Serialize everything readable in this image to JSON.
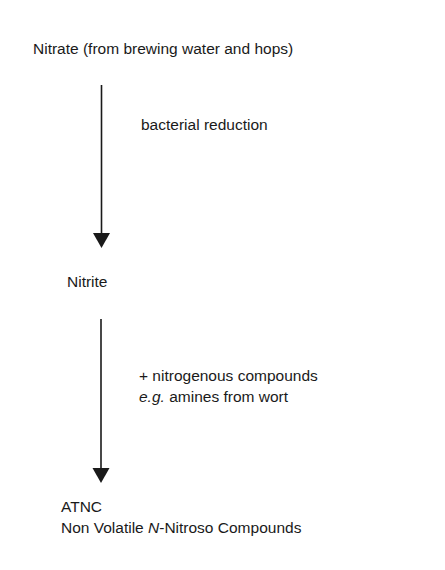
{
  "diagram": {
    "nodes": {
      "nitrate": "Nitrate (from brewing water and hops)",
      "nitrite": "Nitrite",
      "atnc_line1": "ATNC",
      "atnc_line2_pre": "Non Volatile ",
      "atnc_line2_italic": "N",
      "atnc_line2_post": "-Nitroso Compounds"
    },
    "edges": {
      "step1_label": "bacterial reduction",
      "step2_label_line1": "+ nitrogenous compounds",
      "step2_label_line2_italic": "e.g.",
      "step2_label_line2_rest": " amines from wort"
    },
    "colors": {
      "ink": "#1a1a1a",
      "background": "#ffffff"
    }
  }
}
